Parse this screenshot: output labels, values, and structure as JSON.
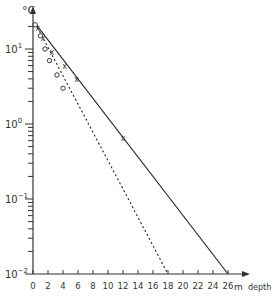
{
  "chart_data": {
    "type": "line",
    "title": "",
    "xlabel": "m depth",
    "ylabel": "°C",
    "x_unit": "m",
    "x_name": "depth",
    "y_scale": "log",
    "xlim": [
      0,
      26
    ],
    "ylim": [
      0.01,
      25
    ],
    "x_ticks": [
      0,
      2,
      4,
      6,
      8,
      10,
      12,
      14,
      16,
      18,
      20,
      22,
      24,
      26
    ],
    "x_tick_labels": [
      "0",
      "2",
      "4",
      "6",
      "8",
      "10",
      "12",
      "14",
      "16",
      "18",
      "20",
      "22",
      "24",
      "26"
    ],
    "y_ticks": [
      0.01,
      0.1,
      1,
      10
    ],
    "y_tick_labels": [
      "10^-2",
      "10^-1",
      "10^0",
      "10^1"
    ],
    "grid": false,
    "legend": null,
    "series": [
      {
        "name": "crosses (solid line)",
        "marker": "x",
        "line_style": "solid",
        "points": [
          [
            0.6,
            19
          ],
          [
            1.3,
            14
          ],
          [
            2.5,
            9
          ],
          [
            4.2,
            6
          ],
          [
            5.8,
            4
          ],
          [
            12,
            0.65
          ]
        ],
        "fit_line": [
          [
            0.3,
            22
          ],
          [
            26,
            0.01
          ]
        ]
      },
      {
        "name": "circles (dashed line)",
        "marker": "o",
        "line_style": "dashed",
        "points": [
          [
            0.3,
            21
          ],
          [
            1.0,
            15
          ],
          [
            1.6,
            10
          ],
          [
            2.2,
            7
          ],
          [
            3.2,
            4.5
          ],
          [
            4.0,
            3
          ]
        ],
        "fit_line": [
          [
            0.3,
            22
          ],
          [
            18,
            0.01
          ]
        ]
      }
    ]
  }
}
